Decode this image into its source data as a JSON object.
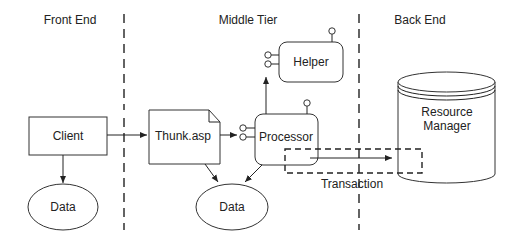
{
  "diagram": {
    "columns": [
      {
        "label": "Front End"
      },
      {
        "label": "Middle Tier"
      },
      {
        "label": "Back End"
      }
    ],
    "nodes": {
      "client": {
        "label": "Client",
        "shape": "rectangle"
      },
      "client_data": {
        "label": "Data",
        "shape": "ellipse"
      },
      "thunk": {
        "label": "Thunk.asp",
        "shape": "document"
      },
      "processor": {
        "label": "Processor",
        "shape": "rounded-component"
      },
      "helper": {
        "label": "Helper",
        "shape": "rounded-component"
      },
      "middle_data": {
        "label": "Data",
        "shape": "ellipse"
      },
      "resource_manager": {
        "label_line1": "Resource",
        "label_line2": "Manager",
        "shape": "cylinder"
      }
    },
    "groups": {
      "transaction": {
        "label": "Transaction",
        "style": "dashed"
      }
    },
    "edges": [
      {
        "from": "Client",
        "to": "Thunk.asp"
      },
      {
        "from": "Client",
        "to": "Data"
      },
      {
        "from": "Thunk.asp",
        "to": "Processor"
      },
      {
        "from": "Thunk.asp",
        "to": "Data"
      },
      {
        "from": "Processor",
        "to": "Data"
      },
      {
        "from": "Processor",
        "to": "Helper"
      },
      {
        "from": "Processor",
        "to": "Resource Manager"
      }
    ],
    "colors": {
      "stroke": "#222222",
      "background": "#ffffff"
    }
  }
}
